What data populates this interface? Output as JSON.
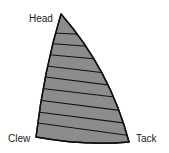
{
  "diagram": {
    "labels": {
      "head": "Head",
      "clew": "Clew",
      "tack": "Tack"
    },
    "colors": {
      "sail_fill": "#8c8c8c",
      "outline": "#111111",
      "background": "#ffffff"
    },
    "panel_count": 10,
    "seam_count": 9
  }
}
